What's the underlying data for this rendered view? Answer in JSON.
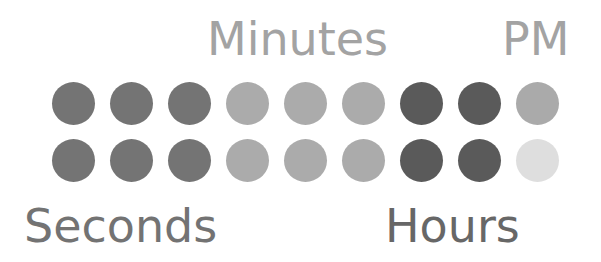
{
  "labels": {
    "minutes": "Minutes",
    "pm": "PM",
    "seconds": "Seconds",
    "hours": "Hours"
  },
  "colors": {
    "seconds_dot": "#747474",
    "minutes_dot": "#ababab",
    "hours_dot": "#5a5a5a",
    "pm_on": "#aaaaaa",
    "pm_off": "#dedede",
    "label_minutes": "#a3a3a3",
    "label_pm": "#a3a3a3",
    "label_seconds": "#737373",
    "label_hours": "#676767"
  },
  "rows": [
    {
      "dots": [
        {
          "group": "seconds",
          "color": "#747474"
        },
        {
          "group": "seconds",
          "color": "#747474"
        },
        {
          "group": "seconds",
          "color": "#747474"
        },
        {
          "group": "minutes",
          "color": "#ababab"
        },
        {
          "group": "minutes",
          "color": "#ababab"
        },
        {
          "group": "minutes",
          "color": "#ababab"
        },
        {
          "group": "hours",
          "color": "#5a5a5a"
        },
        {
          "group": "hours",
          "color": "#5a5a5a"
        },
        {
          "group": "pm",
          "color": "#aaaaaa"
        }
      ]
    },
    {
      "dots": [
        {
          "group": "seconds",
          "color": "#747474"
        },
        {
          "group": "seconds",
          "color": "#747474"
        },
        {
          "group": "seconds",
          "color": "#747474"
        },
        {
          "group": "minutes",
          "color": "#ababab"
        },
        {
          "group": "minutes",
          "color": "#ababab"
        },
        {
          "group": "minutes",
          "color": "#ababab"
        },
        {
          "group": "hours",
          "color": "#5a5a5a"
        },
        {
          "group": "hours",
          "color": "#5a5a5a"
        },
        {
          "group": "pm",
          "color": "#dedede"
        }
      ]
    }
  ]
}
